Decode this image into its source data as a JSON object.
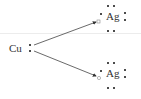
{
  "diagram": {
    "type": "lewis-electron-transfer",
    "donor": {
      "symbol": "Cu",
      "valence_dots": 2
    },
    "acceptors": [
      {
        "symbol": "Ag",
        "dots": 7,
        "received_marker": "open-square"
      },
      {
        "symbol": "Ag",
        "dots": 7,
        "received_marker": "open-circle"
      }
    ],
    "arrows": [
      {
        "from": "Cu",
        "to": "Ag (top)"
      },
      {
        "from": "Cu",
        "to": "Ag (bottom)"
      }
    ],
    "colors": {
      "dot": "#111111",
      "arrow": "#333333",
      "text": "#333333"
    }
  }
}
